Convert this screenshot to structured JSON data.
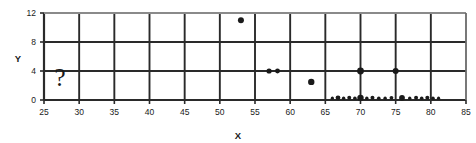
{
  "chart_data": {
    "type": "scatter",
    "title": "",
    "xlabel": "X",
    "ylabel": "Y",
    "xlim": [
      25,
      85
    ],
    "ylim": [
      0,
      12
    ],
    "xticks": [
      25,
      30,
      35,
      40,
      45,
      50,
      55,
      60,
      65,
      70,
      75,
      80,
      85
    ],
    "xticklabels": [
      "25",
      "30",
      "35",
      "40",
      "45",
      "50",
      "55",
      "60",
      "65",
      "70",
      "75",
      "80",
      "85"
    ],
    "yticks": [
      0,
      4,
      8,
      12
    ],
    "yticklabels": [
      "0",
      "4",
      "8",
      "12"
    ],
    "grid": true,
    "grid_x": [
      30,
      35,
      40,
      45,
      50,
      55,
      60,
      65,
      70,
      75,
      80
    ],
    "grid_y": [
      4,
      8
    ],
    "legend": "none",
    "marker_color": "#1a1a1a",
    "frame_color": "#3a3a3a",
    "grid_color": "#2a2a2a",
    "points": [
      {
        "x": 53.0,
        "y": 11.0,
        "r": 3.0
      },
      {
        "x": 57.0,
        "y": 4.0,
        "r": 2.6
      },
      {
        "x": 58.2,
        "y": 4.0,
        "r": 2.4
      },
      {
        "x": 63.0,
        "y": 2.5,
        "r": 3.2
      },
      {
        "x": 70.0,
        "y": 4.0,
        "r": 3.4
      },
      {
        "x": 75.0,
        "y": 4.0,
        "r": 3.0
      },
      {
        "x": 66.0,
        "y": 0.25,
        "r": 1.6
      },
      {
        "x": 66.8,
        "y": 0.3,
        "r": 2.4
      },
      {
        "x": 67.6,
        "y": 0.25,
        "r": 1.7
      },
      {
        "x": 68.4,
        "y": 0.3,
        "r": 2.0
      },
      {
        "x": 69.2,
        "y": 0.25,
        "r": 1.8
      },
      {
        "x": 70.0,
        "y": 0.3,
        "r": 3.2
      },
      {
        "x": 70.9,
        "y": 0.25,
        "r": 1.7
      },
      {
        "x": 71.7,
        "y": 0.3,
        "r": 2.0
      },
      {
        "x": 72.6,
        "y": 0.25,
        "r": 1.8
      },
      {
        "x": 73.5,
        "y": 0.25,
        "r": 1.7
      },
      {
        "x": 74.4,
        "y": 0.3,
        "r": 1.9
      },
      {
        "x": 75.9,
        "y": 0.3,
        "r": 2.9
      },
      {
        "x": 77.0,
        "y": 0.25,
        "r": 1.7
      },
      {
        "x": 77.9,
        "y": 0.3,
        "r": 2.0
      },
      {
        "x": 78.7,
        "y": 0.25,
        "r": 1.8
      },
      {
        "x": 79.5,
        "y": 0.3,
        "r": 2.0
      },
      {
        "x": 80.3,
        "y": 0.25,
        "r": 1.8
      },
      {
        "x": 81.1,
        "y": 0.25,
        "r": 1.6
      }
    ],
    "annotations": [
      {
        "text": "?",
        "x": 27.3,
        "y": 1.9,
        "name": "question-mark-annotation"
      }
    ]
  }
}
